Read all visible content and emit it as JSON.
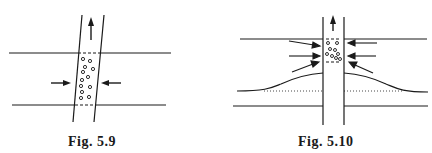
{
  "figures": [
    {
      "id": "fig-5-9",
      "caption": "Fig. 5.9",
      "description": "Slanted tube crossing a horizontal channel; particles inside the tube section; inward horizontal arrows from both sides; upward arrow above tube"
    },
    {
      "id": "fig-5-10",
      "caption": "Fig. 5.10",
      "description": "Vertical tube crossing a channel; converging arrows toward the tube region bounded by dashed lines; raised curved lower boundary with dotted baseline; upward arrow above tube"
    }
  ],
  "colors": {
    "ink": "#1a1a1a",
    "background": "#ffffff"
  }
}
